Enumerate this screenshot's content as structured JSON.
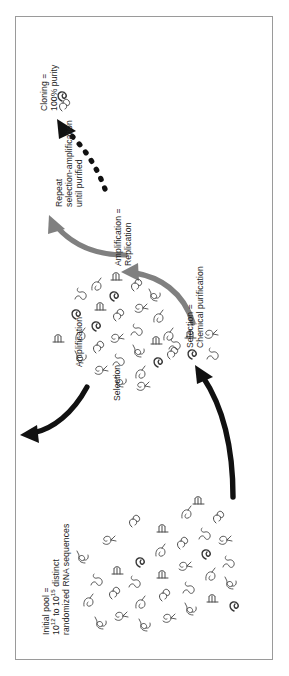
{
  "figure": {
    "type": "process-cycle-diagram",
    "border_color": "#9a9a9a",
    "background": "#ffffff",
    "rotation_degrees": -90
  },
  "labels": {
    "initial_pool": {
      "line1": "Initial pool =",
      "line2_prefix": "10",
      "line2_sup1": "12",
      "line2_mid": " to 10",
      "line2_sup2": "15",
      "line2_suffix": " distinct",
      "line3": "randomized RNA sequences"
    },
    "selection_purification": {
      "line1": "Selection =",
      "line2": "Chemical purification"
    },
    "amplification_replication": {
      "line1": "Amplification =",
      "line2": "Replication"
    },
    "selection": "Selection",
    "amplification": "Amplification",
    "repeat": {
      "line1": "Repeat",
      "line2": "selection-amplification",
      "line3": "until purified"
    },
    "cloning": {
      "line1": "Cloning =",
      "line2": "100% purity"
    }
  },
  "arrows": [
    {
      "name": "selection-chemical-purification-arrow",
      "style": "solid",
      "color": "#111111",
      "from": "initial-pool-cluster",
      "to": "purified-cluster"
    },
    {
      "name": "amplification-replication-arrow",
      "style": "solid",
      "color": "#808080",
      "from": "purified-cluster",
      "to": "amplified-pool-cluster"
    },
    {
      "name": "selection-arrow",
      "style": "solid",
      "color": "#111111",
      "from": "amplified-pool-cluster",
      "to": "selection-stage"
    },
    {
      "name": "amplification-arrow",
      "style": "solid",
      "color": "#808080",
      "from": "selection-stage",
      "to": "repeat-stage"
    },
    {
      "name": "repeat-cycle-dashed-arrow",
      "style": "dashed",
      "color": "#111111",
      "from": "repeat-stage",
      "to": "cloning-stage"
    }
  ],
  "clusters": [
    {
      "name": "initial-pool-cluster",
      "description": "large cluster of randomized RNA secondary-structure squiggles",
      "count": 33
    },
    {
      "name": "purified-cluster",
      "description": "small group of selected RNA squiggles",
      "count": 6
    },
    {
      "name": "amplified-pool-cluster",
      "description": "medium cluster of amplified RNA squiggles",
      "count": 27
    },
    {
      "name": "cloning-stage",
      "description": "single cloned RNA squiggle",
      "count": 1
    }
  ],
  "colors": {
    "ink": "#1d1d1d",
    "black_arrow": "#111111",
    "gray_arrow": "#808080",
    "rna_outline": "#4a4a4a",
    "border": "#9a9a9a"
  }
}
